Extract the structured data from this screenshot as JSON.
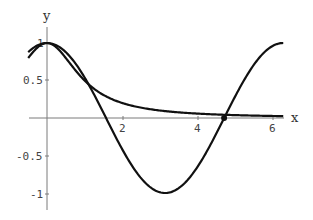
{
  "chart_data": {
    "type": "line",
    "title": "",
    "xlabel": "x",
    "ylabel": "y",
    "xlim": [
      -0.5,
      6.28
    ],
    "ylim": [
      -1.2,
      1.15
    ],
    "x_ticks": [
      "2",
      "4",
      "6"
    ],
    "y_ticks": [
      "1",
      "0.5",
      "-0.5",
      "-1"
    ],
    "grid": false,
    "series": [
      {
        "name": "cos(x)",
        "x": [
          -0.5,
          0,
          1,
          1.5708,
          2,
          3,
          3.1416,
          4,
          4.7124,
          5,
          6,
          6.2832
        ],
        "y": [
          0.878,
          1,
          0.54,
          0,
          -0.416,
          -0.99,
          -1,
          -0.654,
          0,
          0.284,
          0.96,
          1
        ]
      },
      {
        "name": "1/(1+x^2)",
        "x": [
          -0.5,
          0,
          1,
          2,
          3,
          4,
          4.7,
          5,
          6,
          6.2832
        ],
        "y": [
          0.8,
          1,
          0.5,
          0.2,
          0.1,
          0.059,
          0.043,
          0.038,
          0.027,
          0.025
        ]
      }
    ],
    "annotations": [
      {
        "type": "point",
        "x": 4.71,
        "y": 0.0
      }
    ]
  },
  "labels": {
    "x_axis": "x",
    "y_axis": "y",
    "tick_x_2": "2",
    "tick_x_4": "4",
    "tick_x_6": "6",
    "tick_y_1": "1",
    "tick_y_05": "0.5",
    "tick_y_m05": "-0.5",
    "tick_y_m1": "-1"
  }
}
